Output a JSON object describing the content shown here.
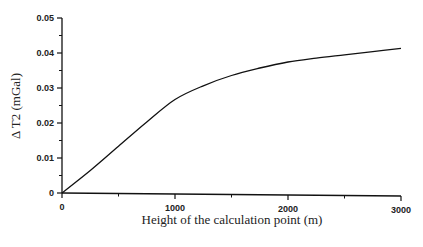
{
  "chart_data": {
    "type": "line",
    "title": "",
    "xlabel": "Height of the calculation point (m)",
    "ylabel": "Δ T2 (mGal)",
    "xlim": [
      0,
      3000
    ],
    "ylim": [
      0,
      0.05
    ],
    "x_ticks": [
      "0",
      "1000",
      "2000",
      "3000"
    ],
    "y_ticks": [
      "0",
      "0.01",
      "0.02",
      "0.03",
      "0.04",
      "0.05"
    ],
    "grid": false,
    "legend": null,
    "series": [
      {
        "name": "Δ T2",
        "x": [
          0,
          250,
          500,
          750,
          1000,
          1250,
          1500,
          1750,
          2000,
          2250,
          2500,
          2750,
          3000
        ],
        "values": [
          0,
          0.0065,
          0.0135,
          0.0205,
          0.027,
          0.031,
          0.034,
          0.0362,
          0.038,
          0.0392,
          0.0402,
          0.0412,
          0.0422
        ]
      }
    ]
  }
}
